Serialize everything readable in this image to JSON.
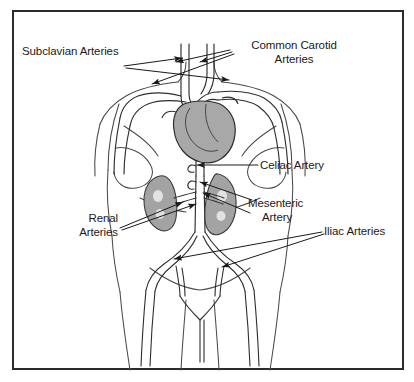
{
  "figure": {
    "kind": "anatomical-illustration",
    "background_color": "#ffffff",
    "frame_color": "#2b2b2b",
    "ink_color": "#1a1a1a",
    "organ_shade_color": "#9a9a9a",
    "vessel_shade_color": "#8c8c8c"
  },
  "labels": {
    "subclavian": {
      "line1": "Subclavian Arteries"
    },
    "carotid": {
      "line1": "Common Carotid",
      "line2": "Arteries"
    },
    "celiac": {
      "line1": "Celiac Artery"
    },
    "mesenteric": {
      "line1": "Mesenteric",
      "line2": "Artery"
    },
    "renal": {
      "line1": "Renal",
      "line2": "Arteries"
    },
    "iliac": {
      "line1": "Iliac Arteries"
    }
  },
  "anatomy": {
    "parts": [
      "torso-outline",
      "heart",
      "aortic-arch",
      "descending-aorta",
      "left-kidney",
      "right-kidney",
      "subclavian-artery-left",
      "subclavian-artery-right",
      "common-carotid-left",
      "common-carotid-right",
      "celiac-trunk",
      "mesenteric-artery",
      "renal-artery-left",
      "renal-artery-right",
      "iliac-artery-left",
      "iliac-artery-right",
      "femoral-artery-left",
      "femoral-artery-right"
    ]
  }
}
